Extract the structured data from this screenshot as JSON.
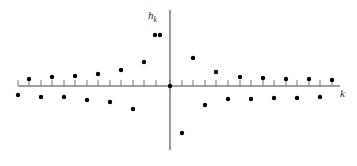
{
  "figure": {
    "kind": "stem-scatter-plot",
    "background_color": "#ffffff",
    "axis_color": "#808080",
    "point_color": "#000000",
    "label_color": "#2b2b2b"
  },
  "axes": {
    "y_axis_label": "h",
    "y_axis_label_sub": "k",
    "x_axis_label": "k",
    "x_axis_pixel_y": 86,
    "y_axis_pixel_x": 170,
    "x_axis_pixel_start": 18,
    "x_axis_pixel_end": 340,
    "y_axis_pixel_start": 10,
    "y_axis_pixel_end": 150,
    "tick_spacing_px": 11.5,
    "tick_length_px": 6,
    "tick_count": 28
  },
  "chart_data": {
    "type": "scatter",
    "title": "",
    "xlabel": "k",
    "ylabel": "h_k",
    "grid": false,
    "legend": null,
    "xlim": [
      -14,
      14
    ],
    "ylim": [
      -1.0,
      1.0
    ],
    "x": [
      -14,
      -13,
      -12,
      -11,
      -10,
      -9,
      -8,
      -7,
      -6,
      -5,
      -4,
      -3,
      -2,
      -1,
      0,
      1,
      2,
      3,
      4,
      5,
      6,
      7,
      8,
      9,
      10,
      11,
      12,
      13,
      14
    ],
    "values": [
      -0.07,
      0.08,
      -0.09,
      0.1,
      -0.11,
      0.13,
      -0.15,
      0.18,
      -0.22,
      0.28,
      -0.37,
      0.52,
      -0.8,
      1.0,
      0.0,
      0.62,
      -0.55,
      0.3,
      -0.21,
      0.27,
      -0.16,
      0.2,
      -0.13,
      0.17,
      -0.1,
      0.14,
      -0.09,
      0.12,
      -0.08
    ],
    "point_pixels": [
      {
        "k": -14,
        "x": 18,
        "y": 95
      },
      {
        "k": -13,
        "x": 29,
        "y": 79
      },
      {
        "k": -12,
        "x": 41,
        "y": 97
      },
      {
        "k": -11,
        "x": 52,
        "y": 77
      },
      {
        "k": -10,
        "x": 64,
        "y": 97
      },
      {
        "k": -9,
        "x": 75,
        "y": 76
      },
      {
        "k": -8,
        "x": 87,
        "y": 100
      },
      {
        "k": -7,
        "x": 98,
        "y": 74
      },
      {
        "k": -6,
        "x": 110,
        "y": 102
      },
      {
        "k": -5,
        "x": 121,
        "y": 70
      },
      {
        "k": -4,
        "x": 133,
        "y": 109
      },
      {
        "k": -3,
        "x": 144,
        "y": 62
      },
      {
        "k": -2,
        "x": 155,
        "y": 35
      },
      {
        "k": -1,
        "x": 160,
        "y": 35
      },
      {
        "k": 0,
        "x": 170,
        "y": 86
      },
      {
        "k": 1,
        "x": 193,
        "y": 58
      },
      {
        "k": 2,
        "x": 182,
        "y": 133
      },
      {
        "k": 3,
        "x": 205,
        "y": 105
      },
      {
        "k": 4,
        "x": 216,
        "y": 72
      },
      {
        "k": 5,
        "x": 228,
        "y": 99
      },
      {
        "k": 6,
        "x": 240,
        "y": 77
      },
      {
        "k": 7,
        "x": 251,
        "y": 99
      },
      {
        "k": 8,
        "x": 263,
        "y": 78
      },
      {
        "k": 9,
        "x": 274,
        "y": 98
      },
      {
        "k": 10,
        "x": 286,
        "y": 79
      },
      {
        "k": 11,
        "x": 297,
        "y": 98
      },
      {
        "k": 12,
        "x": 309,
        "y": 79
      },
      {
        "k": 13,
        "x": 320,
        "y": 97
      },
      {
        "k": 14,
        "x": 332,
        "y": 80
      }
    ],
    "tick_pixels_x": [
      18,
      29,
      41,
      52,
      64,
      75,
      87,
      98,
      110,
      121,
      133,
      144,
      156,
      170,
      182,
      193,
      205,
      216,
      228,
      240,
      251,
      263,
      274,
      286,
      297,
      309,
      320,
      332
    ]
  }
}
